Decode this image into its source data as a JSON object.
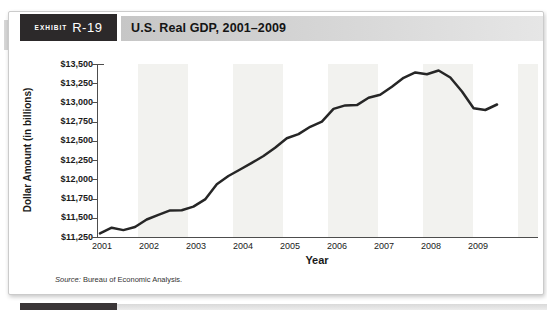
{
  "exhibit": {
    "label": "EXHIBIT",
    "number": "R-19",
    "title": "U.S. Real GDP, 2001–2009"
  },
  "source": {
    "prefix": "Source:",
    "text": " Bureau of Economic Analysis."
  },
  "chart_data": {
    "type": "line",
    "title": "U.S. Real GDP, 2001–2009",
    "xlabel": "Year",
    "ylabel": "Dollar Amount (in billions)",
    "x_tick_labels": [
      "2001",
      "2002",
      "2003",
      "2004",
      "2005",
      "2006",
      "2007",
      "2008",
      "2009"
    ],
    "y_tick_labels": [
      "$13,500",
      "$13,250",
      "$13,000",
      "$12,750",
      "$12,500",
      "$12,250",
      "$12,000",
      "$11,750",
      "$11,500",
      "$11,250"
    ],
    "ylim": [
      11250,
      13500
    ],
    "grid": false,
    "legend": "none",
    "series_name": "U.S. Real GDP (billions of dollars)",
    "x_quarters": [
      "2001 Q1",
      "2001 Q2",
      "2001 Q3",
      "2001 Q4",
      "2002 Q1",
      "2002 Q2",
      "2002 Q3",
      "2002 Q4",
      "2003 Q1",
      "2003 Q2",
      "2003 Q3",
      "2003 Q4",
      "2004 Q1",
      "2004 Q2",
      "2004 Q3",
      "2004 Q4",
      "2005 Q1",
      "2005 Q2",
      "2005 Q3",
      "2005 Q4",
      "2006 Q1",
      "2006 Q2",
      "2006 Q3",
      "2006 Q4",
      "2007 Q1",
      "2007 Q2",
      "2007 Q3",
      "2007 Q4",
      "2008 Q1",
      "2008 Q2",
      "2008 Q3",
      "2008 Q4",
      "2009 Q1",
      "2009 Q2",
      "2009 Q3"
    ],
    "values": [
      11297,
      11371,
      11340,
      11380,
      11478,
      11539,
      11596,
      11599,
      11646,
      11739,
      11936,
      12043,
      12128,
      12214,
      12304,
      12410,
      12534,
      12588,
      12683,
      12749,
      12916,
      12962,
      12966,
      13061,
      13100,
      13204,
      13321,
      13391,
      13367,
      13415,
      13325,
      13142,
      12925,
      12902,
      12973
    ],
    "line_color": "#262626",
    "stripe_color": "#f2f2ef"
  },
  "colors": {
    "exhibit_box": "#2c292a",
    "header_bar_left": "#c6c6c6",
    "header_bar_right": "#e6e6e6",
    "axis": "#4d4d4d"
  }
}
